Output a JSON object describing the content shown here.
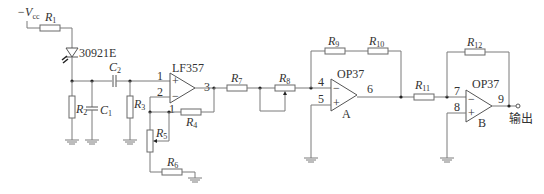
{
  "diagram": {
    "type": "circuit-schematic",
    "supply": {
      "label": "−V",
      "subscript": "cc"
    },
    "photodiode": {
      "label": "30921E"
    },
    "resistors": {
      "R1": {
        "letter": "R",
        "sub": "1"
      },
      "R2": {
        "letter": "R",
        "sub": "2"
      },
      "R3": {
        "letter": "R",
        "sub": "3"
      },
      "R4": {
        "letter": "R",
        "sub": "4"
      },
      "R5": {
        "letter": "R",
        "sub": "5"
      },
      "R6": {
        "letter": "R",
        "sub": "6"
      },
      "R7": {
        "letter": "R",
        "sub": "7"
      },
      "R8": {
        "letter": "R",
        "sub": "8"
      },
      "R9": {
        "letter": "R",
        "sub": "9"
      },
      "R10": {
        "letter": "R",
        "sub": "10"
      },
      "R11": {
        "letter": "R",
        "sub": "11"
      },
      "R12": {
        "letter": "R",
        "sub": "12"
      }
    },
    "capacitors": {
      "C1": {
        "letter": "C",
        "sub": "1"
      },
      "C2": {
        "letter": "C",
        "sub": "2"
      }
    },
    "opamps": {
      "u1": {
        "name": "LF357",
        "pins": {
          "in_plus": "1",
          "in_minus": "2",
          "out": "3",
          "aux": "1"
        }
      },
      "uA": {
        "name": "OP37",
        "tag": "A",
        "pins": {
          "in_minus": "4",
          "in_plus": "5",
          "out": "6"
        }
      },
      "uB": {
        "name": "OP37",
        "tag": "B",
        "pins": {
          "in_minus": "7",
          "in_plus": "8",
          "out": "9"
        }
      }
    },
    "output_label": "输出"
  }
}
